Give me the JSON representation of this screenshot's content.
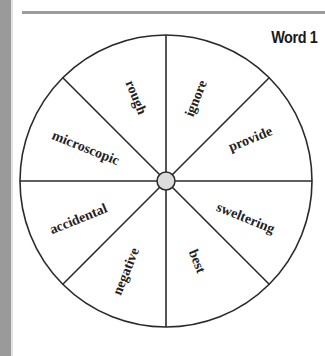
{
  "title": "Word 1",
  "wheel": {
    "center": {
      "x": 166,
      "y": 181
    },
    "radius": 146,
    "hub_radius": 9,
    "colors": {
      "stroke": "#2a2a2a",
      "hub_fill": "#dcdcdc",
      "text": "#222222"
    },
    "segments": [
      {
        "label": "ignore"
      },
      {
        "label": "provide"
      },
      {
        "label": "sweltering"
      },
      {
        "label": "best"
      },
      {
        "label": "negative"
      },
      {
        "label": "accidental"
      },
      {
        "label": "microscopic"
      },
      {
        "label": "rough"
      }
    ]
  }
}
